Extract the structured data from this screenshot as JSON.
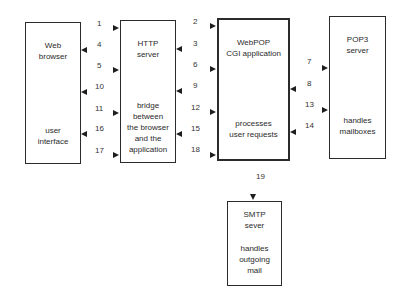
{
  "boxes": {
    "web_browser": {
      "title": "Web\nbrowser",
      "desc": "user\ninterface"
    },
    "http_server": {
      "title": "HTTP\nserver",
      "desc": "bridge\nbetween\nthe browser\nand the\napplication"
    },
    "webpop": {
      "title": "WebPOP\nCGI application",
      "desc": "processes\nuser requests"
    },
    "pop3": {
      "title": "POP3\nserver",
      "desc": "handles\nmailboxes"
    },
    "smtp": {
      "title": "SMTP\nsever",
      "desc": "handles\noutgoing\nmail"
    }
  },
  "arrows": {
    "a1": "1",
    "a2": "2",
    "a3": "3",
    "a4": "4",
    "a5": "5",
    "a6": "6",
    "a7": "7",
    "a8": "8",
    "a9": "9",
    "a10": "10",
    "a11": "11",
    "a12": "12",
    "a13": "13",
    "a14": "14",
    "a15": "15",
    "a16": "16",
    "a17": "17",
    "a18": "18",
    "a19": "19"
  }
}
